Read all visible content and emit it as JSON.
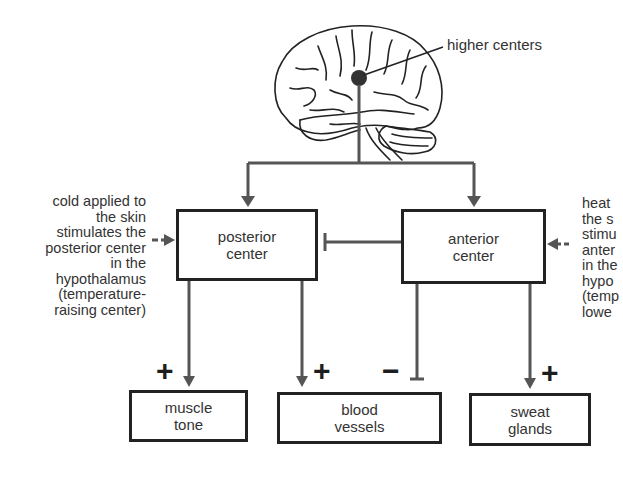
{
  "diagram": {
    "brain_label": "higher centers",
    "centers": {
      "posterior": "posterior\ncenter",
      "anterior": "anterior\ncenter"
    },
    "effectors": {
      "muscle": "muscle\ntone",
      "blood": "blood\nvessels",
      "sweat": "sweat\nglands"
    },
    "left_note": "cold applied to\nthe skin\nstimulates the\nposterior center\nin the\nhypothalamus\n(temperature-\nraising center)",
    "right_note": "heat\nthe s\nstimu\nanter\nin the\nhypo\n(temp\nlowe",
    "signs": {
      "muscle": "+",
      "blood_plus": "+",
      "blood_minus": "−",
      "sweat": "+"
    },
    "colors": {
      "line": "#555555",
      "box_border": "#222222",
      "text": "#333333"
    }
  }
}
